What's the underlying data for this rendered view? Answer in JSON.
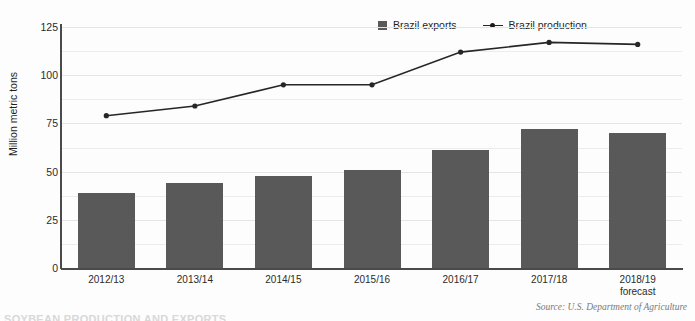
{
  "chart_data": {
    "type": "bar",
    "title": "",
    "subtitle": "",
    "xlabel": "",
    "ylabel": "Million metric tons",
    "ylim": [
      0,
      125
    ],
    "yticks": [
      0,
      25,
      50,
      75,
      100,
      125
    ],
    "grid": true,
    "legend_position": "top-center",
    "categories": [
      "2012/13",
      "2013/14",
      "2014/15",
      "2015/16",
      "2016/17",
      "2017/18",
      "2018/19"
    ],
    "category_sublabels": [
      "",
      "",
      "",
      "",
      "",
      "",
      "forecast"
    ],
    "series": [
      {
        "name": "Brazil exports",
        "type": "bar",
        "color": "#595959",
        "values": [
          39,
          44,
          48,
          51,
          61,
          72,
          70
        ]
      },
      {
        "name": "Brazil production",
        "type": "line",
        "color": "#262626",
        "values": [
          79,
          84,
          95,
          95,
          112,
          117,
          116
        ]
      }
    ]
  },
  "legend": {
    "items": [
      {
        "label": "Brazil exports",
        "marker": "square-swatch",
        "color": "#595959"
      },
      {
        "label": "Brazil production",
        "marker": "line-with-dot",
        "color": "#262626"
      }
    ]
  },
  "axes": {
    "y_title": "Million metric tons",
    "y_tick_labels": [
      "125",
      "100",
      "75",
      "50",
      "25",
      "0"
    ],
    "x_tick_labels": [
      "2012/13",
      "2013/14",
      "2014/15",
      "2015/16",
      "2016/17",
      "2017/18",
      "2018/19"
    ],
    "x_tick_sublabels": [
      "",
      "",
      "",
      "",
      "",
      "",
      "forecast"
    ]
  },
  "footer": {
    "source": "Source: U.S. Department of Agriculture",
    "clipped_heading": "SOYBEAN PRODUCTION AND EXPORTS"
  },
  "colors": {
    "bar": "#595959",
    "line": "#262626",
    "axis": "#4a4a4a",
    "grid": "#ececec",
    "background": "#fdfdfd",
    "text": "#2b2b2b",
    "source_text": "#7a7a7a"
  }
}
